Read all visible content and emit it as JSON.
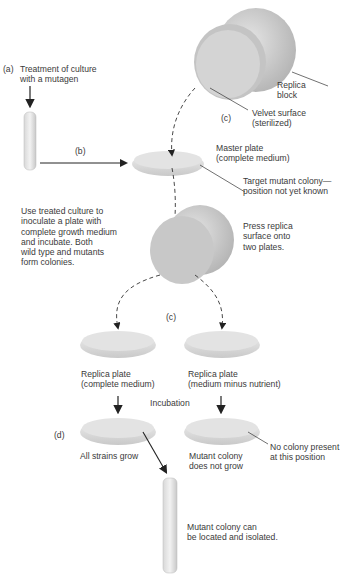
{
  "figure": {
    "steps": {
      "a": {
        "marker": "(a)",
        "text": "Treatment of culture\nwith a mutagen"
      },
      "b": {
        "marker": "(b)",
        "text": "Use treated culture to\ninoculate a plate with\ncomplete growth medium\nand incubate. Both\nwild type and mutants\nform colonies."
      },
      "c_top": {
        "marker": "(c)"
      },
      "c_mid": {
        "marker": "(c)"
      },
      "d": {
        "marker": "(d)"
      }
    },
    "labels": {
      "replica_block": "Replica\nblock",
      "velvet_surface": "Velvet surface\n(sterilized)",
      "master_plate": "Master plate\n(complete medium)",
      "target_colony": "Target mutant colony—\nposition not yet known",
      "press_replica": "Press replica\nsurface onto\ntwo plates.",
      "replica_plate_complete": "Replica plate\n(complete medium)",
      "replica_plate_minus": "Replica plate\n(medium minus nutrient)",
      "incubation": "Incubation",
      "all_strains_grow": "All strains grow",
      "mutant_not_grow": "Mutant colony\ndoes not grow",
      "no_colony": "No colony present\nat this position",
      "isolated": "Mutant colony can\nbe located and isolated."
    }
  }
}
